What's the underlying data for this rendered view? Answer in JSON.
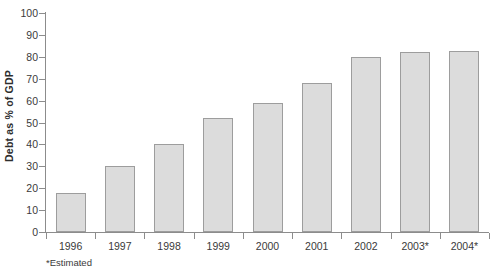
{
  "chart_data": {
    "type": "bar",
    "title": "",
    "subtitle": "",
    "xlabel": "",
    "ylabel": "Debt as % of GDP",
    "categories": [
      "1996",
      "1997",
      "1998",
      "1999",
      "2000",
      "2001",
      "2002",
      "2003*",
      "2004*"
    ],
    "values": [
      18,
      30,
      40,
      52,
      59,
      68,
      80,
      82,
      82.5
    ],
    "ylim": [
      0,
      100
    ],
    "yticks": [
      0,
      10,
      20,
      30,
      40,
      50,
      60,
      70,
      80,
      90,
      100
    ],
    "ytick_labels": [
      "0",
      "10",
      "20",
      "30",
      "40",
      "50",
      "60",
      "70",
      "80",
      "90",
      "100"
    ],
    "grid": false,
    "legend": null,
    "legend_position": "none",
    "annotations": [
      "*Estimated"
    ],
    "series": [
      {
        "name": "Debt as % of GDP",
        "values": [
          18,
          30,
          40,
          52,
          59,
          68,
          80,
          82,
          82.5
        ]
      }
    ],
    "colors": {
      "bar_fill": "#dcdcdc",
      "bar_border": "#9d9d9d",
      "axis": "#8c8c8c",
      "text": "#3a3a3a",
      "background": "#ffffff"
    }
  },
  "footnote": {
    "text": "*Estimated"
  }
}
